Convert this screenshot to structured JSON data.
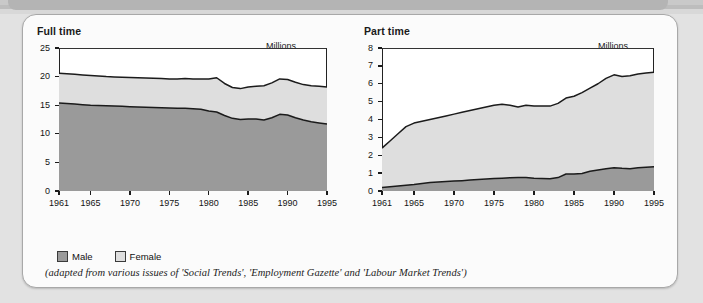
{
  "card": {
    "caption": "(adapted from various issues of 'Social Trends', 'Employment Gazette' and 'Labour Market Trends')"
  },
  "legend": {
    "items": [
      {
        "label": "Male",
        "color": "#9a9a9a"
      },
      {
        "label": "Female",
        "color": "#dedede"
      }
    ]
  },
  "colors": {
    "male": "#9a9a9a",
    "female": "#dedede",
    "line": "#1b1b1b",
    "plot_bg": "#ffffff",
    "card_bg": "#fbfbfb",
    "page_bg": "#e2e2e2"
  },
  "chart_data": [
    {
      "type": "area",
      "id": "full-time",
      "title": "Full time",
      "units_label": "Millions",
      "xlabel": "",
      "ylabel": "Millions",
      "stacked": true,
      "grid": false,
      "legend_position": "below-figure",
      "xlim": [
        1961,
        1995
      ],
      "ylim": [
        0,
        25
      ],
      "yticks": [
        0,
        5,
        10,
        15,
        20,
        25
      ],
      "ytick_labels": [
        "0",
        "5",
        "10",
        "15",
        "20",
        "25"
      ],
      "xticks": [
        1961,
        1965,
        1970,
        1975,
        1980,
        1985,
        1990,
        1995
      ],
      "xtick_labels": [
        "1961",
        "1965",
        "1970",
        "1975",
        "1980",
        "1985",
        "1990",
        "1995"
      ],
      "x": [
        1961,
        1962,
        1963,
        1964,
        1965,
        1966,
        1967,
        1968,
        1969,
        1970,
        1971,
        1972,
        1973,
        1974,
        1975,
        1976,
        1977,
        1978,
        1979,
        1980,
        1981,
        1982,
        1983,
        1984,
        1985,
        1986,
        1987,
        1988,
        1989,
        1990,
        1991,
        1992,
        1993,
        1994,
        1995
      ],
      "series": [
        {
          "name": "Male",
          "color": "#9a9a9a",
          "values": [
            15.4,
            15.3,
            15.2,
            15.1,
            15.0,
            14.95,
            14.9,
            14.85,
            14.8,
            14.75,
            14.7,
            14.65,
            14.6,
            14.55,
            14.5,
            14.45,
            14.45,
            14.4,
            14.3,
            14.0,
            13.8,
            13.2,
            12.7,
            12.5,
            12.6,
            12.6,
            12.4,
            12.8,
            13.4,
            13.3,
            12.8,
            12.4,
            12.1,
            11.9,
            11.7
          ]
        },
        {
          "name": "Female",
          "color": "#dedede",
          "values": [
            5.2,
            5.2,
            5.2,
            5.2,
            5.2,
            5.15,
            5.1,
            5.1,
            5.1,
            5.1,
            5.1,
            5.1,
            5.1,
            5.1,
            5.1,
            5.15,
            5.2,
            5.2,
            5.3,
            5.6,
            6.0,
            5.6,
            5.4,
            5.4,
            5.6,
            5.7,
            6.0,
            6.1,
            6.2,
            6.2,
            6.2,
            6.2,
            6.3,
            6.4,
            6.5
          ]
        }
      ],
      "totals": [
        20.6,
        20.5,
        20.4,
        20.3,
        20.2,
        20.1,
        20.0,
        19.95,
        19.9,
        19.85,
        19.8,
        19.75,
        19.7,
        19.65,
        19.6,
        19.6,
        19.65,
        19.6,
        19.6,
        19.6,
        19.8,
        18.8,
        18.1,
        17.9,
        18.2,
        18.3,
        18.4,
        18.9,
        19.6,
        19.5,
        19.0,
        18.6,
        18.4,
        18.3,
        18.2
      ]
    },
    {
      "type": "area",
      "id": "part-time",
      "title": "Part time",
      "units_label": "Millions",
      "xlabel": "",
      "ylabel": "Millions",
      "stacked": true,
      "grid": false,
      "legend_position": "below-figure",
      "xlim": [
        1961,
        1995
      ],
      "ylim": [
        0,
        8
      ],
      "yticks": [
        0,
        1,
        2,
        3,
        4,
        5,
        6,
        7,
        8
      ],
      "ytick_labels": [
        "0",
        "1",
        "2",
        "3",
        "4",
        "5",
        "6",
        "7",
        "8"
      ],
      "xticks": [
        1961,
        1965,
        1970,
        1975,
        1980,
        1985,
        1990,
        1995
      ],
      "xtick_labels": [
        "1961",
        "1965",
        "1970",
        "1975",
        "1980",
        "1985",
        "1990",
        "1995"
      ],
      "x": [
        1961,
        1962,
        1963,
        1964,
        1965,
        1966,
        1967,
        1968,
        1969,
        1970,
        1971,
        1972,
        1973,
        1974,
        1975,
        1976,
        1977,
        1978,
        1979,
        1980,
        1981,
        1982,
        1983,
        1984,
        1985,
        1986,
        1987,
        1988,
        1989,
        1990,
        1991,
        1992,
        1993,
        1994,
        1995
      ],
      "series": [
        {
          "name": "Male",
          "color": "#9a9a9a",
          "values": [
            0.2,
            0.24,
            0.28,
            0.32,
            0.36,
            0.42,
            0.47,
            0.5,
            0.53,
            0.56,
            0.58,
            0.61,
            0.64,
            0.67,
            0.7,
            0.72,
            0.74,
            0.75,
            0.75,
            0.72,
            0.7,
            0.68,
            0.75,
            0.95,
            0.95,
            0.98,
            1.1,
            1.18,
            1.25,
            1.3,
            1.27,
            1.25,
            1.3,
            1.33,
            1.35
          ]
        },
        {
          "name": "Female",
          "color": "#dedede",
          "values": [
            2.2,
            2.56,
            2.92,
            3.28,
            3.44,
            3.48,
            3.53,
            3.6,
            3.67,
            3.74,
            3.82,
            3.89,
            3.96,
            4.03,
            4.1,
            4.13,
            4.06,
            3.95,
            4.05,
            4.03,
            4.05,
            4.07,
            4.15,
            4.25,
            4.35,
            4.52,
            4.65,
            4.82,
            5.05,
            5.2,
            5.13,
            5.2,
            5.25,
            5.27,
            5.3
          ]
        }
      ],
      "totals": [
        2.4,
        2.8,
        3.2,
        3.6,
        3.8,
        3.9,
        4.0,
        4.1,
        4.2,
        4.3,
        4.4,
        4.5,
        4.6,
        4.7,
        4.8,
        4.85,
        4.8,
        4.7,
        4.8,
        4.75,
        4.75,
        4.75,
        4.9,
        5.2,
        5.3,
        5.5,
        5.75,
        6.0,
        6.3,
        6.5,
        6.4,
        6.45,
        6.55,
        6.6,
        6.65
      ]
    }
  ]
}
